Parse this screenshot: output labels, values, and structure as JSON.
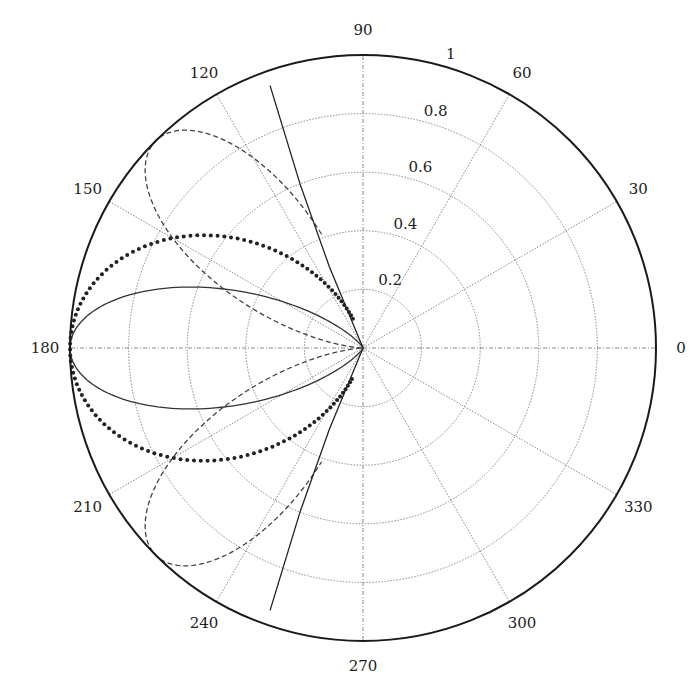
{
  "chart_data": {
    "type": "polar",
    "title": "",
    "angular_ticks": [
      0,
      30,
      60,
      90,
      120,
      150,
      180,
      210,
      240,
      270,
      300,
      330
    ],
    "angular_tick_labels": [
      "0",
      "30",
      "60",
      "90",
      "120",
      "150",
      "180",
      "210",
      "240",
      "270",
      "300",
      "330"
    ],
    "radial_ticks": [
      0.2,
      0.4,
      0.6,
      0.8,
      1
    ],
    "radial_tick_labels": [
      "0.2",
      "0.4",
      "0.6",
      "0.8",
      "1"
    ],
    "rlim": [
      0,
      1
    ],
    "grid": true,
    "legend": null,
    "series": [
      {
        "name": "dotted-pattern",
        "style": "dotted",
        "formula": "r = cos^2(theta)",
        "theta_range_deg": [
          109,
          251
        ],
        "sample_points": [
          [
            109,
            0.11
          ],
          [
            120,
            0.25
          ],
          [
            143,
            0.64
          ],
          [
            160,
            0.88
          ],
          [
            180,
            1.0
          ],
          [
            200,
            0.88
          ],
          [
            217,
            0.64
          ],
          [
            240,
            0.25
          ],
          [
            251,
            0.11
          ]
        ]
      },
      {
        "name": "solid-lobe",
        "style": "solid",
        "formula": "r = |cos(theta)|^8 (approx)",
        "theta_range_deg": [
          90,
          270
        ],
        "sample_points": [
          [
            150,
            0.32
          ],
          [
            159,
            0.59
          ],
          [
            170,
            0.88
          ],
          [
            180,
            1.0
          ],
          [
            190,
            0.88
          ],
          [
            201,
            0.59
          ],
          [
            210,
            0.32
          ]
        ]
      },
      {
        "name": "dashed-lobes",
        "style": "dashed",
        "formula": "r = sin^2(2*theta)",
        "theta_range_deg": [
          110,
          250
        ],
        "sample_points": [
          [
            110,
            0.41
          ],
          [
            126,
            0.9
          ],
          [
            135,
            1.0
          ],
          [
            153,
            0.65
          ],
          [
            180,
            0.0
          ],
          [
            207,
            0.65
          ],
          [
            225,
            1.0
          ],
          [
            234,
            0.9
          ],
          [
            250,
            0.41
          ]
        ]
      },
      {
        "name": "solid-near-radial-lines",
        "style": "solid",
        "sample_points_upper": [
          [
            109.5,
            0.95
          ],
          [
            111,
            0.6
          ],
          [
            112.5,
            0.3
          ],
          [
            114,
            0.0
          ]
        ],
        "sample_points_lower": [
          [
            250.5,
            0.95
          ],
          [
            249,
            0.6
          ],
          [
            247.5,
            0.3
          ],
          [
            246,
            0.0
          ]
        ]
      }
    ]
  }
}
